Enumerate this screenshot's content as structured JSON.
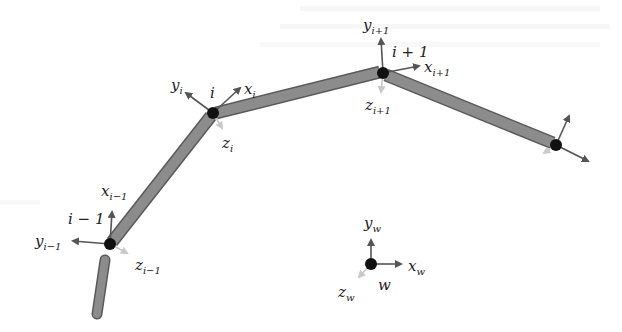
{
  "figure": {
    "type": "kinematic-chain-diagram",
    "colors": {
      "link_fill": "#8c8c8c",
      "link_stroke": "#5a5a5a",
      "joint": "#111111",
      "axis_dark": "#555555",
      "axis_light": "#c8c8c8",
      "text": "#222222"
    },
    "joints": [
      {
        "id": "i-1",
        "label": "i − 1",
        "x": 110,
        "y": 244,
        "axes": {
          "x": {
            "base": "x",
            "sub": "i−1"
          },
          "y": {
            "base": "y",
            "sub": "i−1"
          },
          "z": {
            "base": "z",
            "sub": "i−1"
          }
        }
      },
      {
        "id": "i",
        "label": "i",
        "x": 213,
        "y": 113,
        "axes": {
          "x": {
            "base": "x",
            "sub": "i"
          },
          "y": {
            "base": "y",
            "sub": "i"
          },
          "z": {
            "base": "z",
            "sub": "i"
          }
        }
      },
      {
        "id": "i+1",
        "label": "i + 1",
        "x": 383,
        "y": 73,
        "axes": {
          "x": {
            "base": "x",
            "sub": "i+1"
          },
          "y": {
            "base": "y",
            "sub": "i+1"
          },
          "z": {
            "base": "z",
            "sub": "i+1"
          }
        }
      },
      {
        "id": "end",
        "label": "",
        "x": 556,
        "y": 145
      }
    ],
    "world_frame": {
      "label": "w",
      "x": 371,
      "y": 264,
      "axes": {
        "x": {
          "base": "x",
          "sub": "w"
        },
        "y": {
          "base": "y",
          "sub": "w"
        },
        "z": {
          "base": "z",
          "sub": "w"
        }
      }
    }
  }
}
